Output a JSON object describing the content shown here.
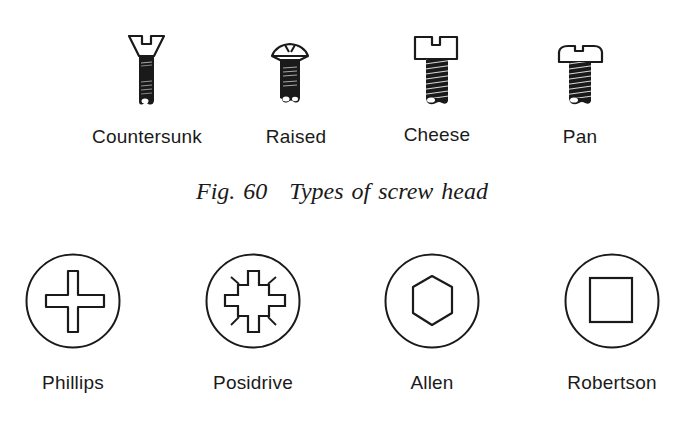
{
  "figure": {
    "number_label": "Fig. 60",
    "title": "Types of screw head"
  },
  "screw_heads": [
    {
      "name": "Countersunk",
      "icon": "countersunk-screw-icon",
      "cx": 147
    },
    {
      "name": "Raised",
      "icon": "raised-screw-icon",
      "cx": 290
    },
    {
      "name": "Cheese",
      "icon": "cheese-screw-icon",
      "cx": 437
    },
    {
      "name": "Pan",
      "icon": "pan-screw-icon",
      "cx": 580
    }
  ],
  "drive_types": [
    {
      "name": "Phillips",
      "icon": "phillips-drive-icon",
      "cx": 73
    },
    {
      "name": "Posidrive",
      "icon": "posidrive-drive-icon",
      "cx": 253
    },
    {
      "name": "Allen",
      "icon": "allen-hex-drive-icon",
      "cx": 432
    },
    {
      "name": "Robertson",
      "icon": "robertson-square-drive-icon",
      "cx": 612
    }
  ],
  "colors": {
    "ink": "#1a1a1a",
    "background": "#ffffff"
  }
}
